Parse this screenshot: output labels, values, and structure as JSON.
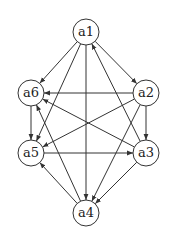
{
  "nodes": [
    {
      "id": "a1",
      "label": "a1",
      "x": 86,
      "y": 32
    },
    {
      "id": "a2",
      "label": "a2",
      "x": 146,
      "y": 93
    },
    {
      "id": "a3",
      "label": "a3",
      "x": 146,
      "y": 153
    },
    {
      "id": "a4",
      "label": "a4",
      "x": 86,
      "y": 213
    },
    {
      "id": "a5",
      "label": "a5",
      "x": 31,
      "y": 153
    },
    {
      "id": "a6",
      "label": "a6",
      "x": 31,
      "y": 93
    }
  ],
  "edges": [
    [
      "a1",
      "a6"
    ],
    [
      "a1",
      "a2"
    ],
    [
      "a1",
      "a5"
    ],
    [
      "a1",
      "a4"
    ],
    [
      "a3",
      "a1"
    ],
    [
      "a2",
      "a6"
    ],
    [
      "a2",
      "a3"
    ],
    [
      "a2",
      "a5"
    ],
    [
      "a2",
      "a4"
    ],
    [
      "a6",
      "a5"
    ],
    [
      "a3",
      "a6"
    ],
    [
      "a4",
      "a6"
    ],
    [
      "a5",
      "a3"
    ],
    [
      "a4",
      "a5"
    ],
    [
      "a3",
      "a4"
    ]
  ],
  "style": {
    "stroke": "#333333",
    "node_radius": 13
  }
}
